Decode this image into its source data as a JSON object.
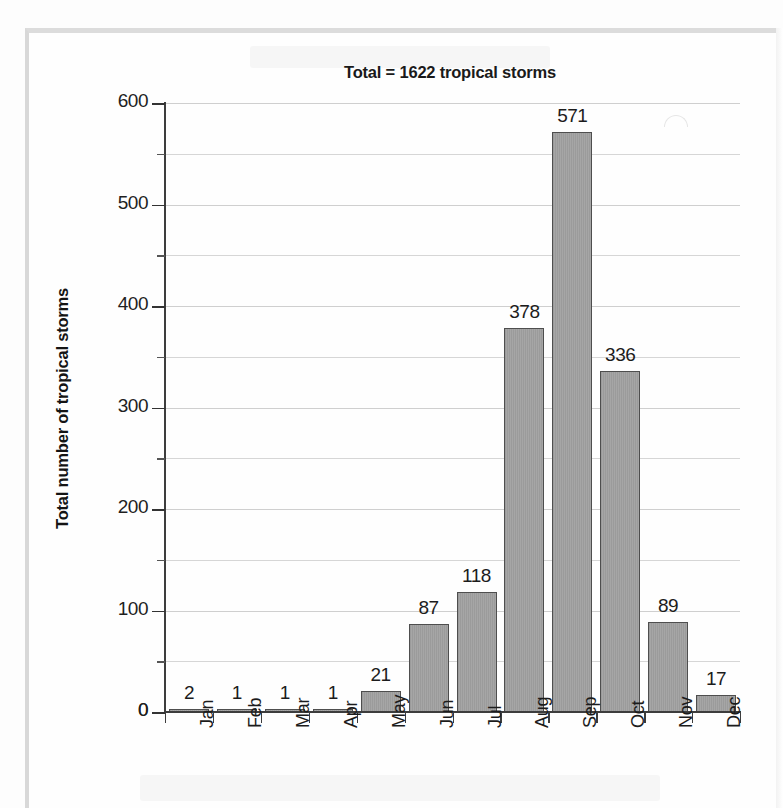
{
  "chart_data": {
    "type": "bar",
    "title": "Total = 1622 tropical storms",
    "xlabel": "",
    "ylabel": "Total number of tropical storms",
    "categories": [
      "Jan",
      "Feb",
      "Mar",
      "Apr",
      "May",
      "Jun",
      "Jul",
      "Aug",
      "Sep",
      "Oct",
      "Nov",
      "Dec"
    ],
    "values": [
      2,
      1,
      1,
      1,
      21,
      87,
      118,
      378,
      571,
      336,
      89,
      17
    ],
    "value_labels": [
      "2",
      "1",
      "1",
      "1",
      "21",
      "87",
      "118",
      "378",
      "571",
      "336",
      "89",
      "17"
    ],
    "ylim": [
      0,
      600
    ],
    "y_major_ticks": [
      0,
      100,
      200,
      300,
      400,
      500,
      600
    ],
    "y_major_tick_labels": [
      "0",
      "100",
      "200",
      "300",
      "400",
      "500",
      "600"
    ],
    "y_minor_ticks": [
      50,
      150,
      250,
      350,
      450,
      550
    ],
    "grid": true,
    "grid_axis": "y",
    "legend": false,
    "total": 1622,
    "bar_fill_color": "#9e9e9e",
    "bar_border_color": "#4e4e4e",
    "gridline_color": "#d6d6d6",
    "axis_color": "#3d3d3d",
    "text_color": "#1c1c1c"
  },
  "page": {
    "background_color": "#fdfdfd",
    "frame_color": "#d8d8d8"
  }
}
